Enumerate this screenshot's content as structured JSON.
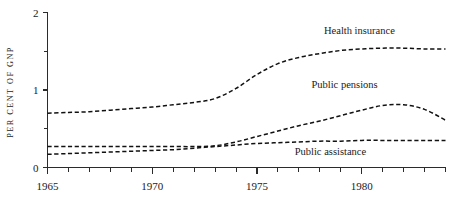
{
  "chart_data": {
    "type": "line",
    "title": "",
    "xlabel": "",
    "ylabel": "PER CENT OF GNP",
    "xlim": [
      1965,
      1984
    ],
    "ylim": [
      0,
      2
    ],
    "grid": false,
    "legend_position": "inline-right",
    "line_style": "dashed",
    "x_ticks_major": [
      1965,
      1970,
      1975,
      1980
    ],
    "x_tick_labels": [
      "1965",
      "1970",
      "1975",
      "1980"
    ],
    "x_ticks_minor": [
      1966,
      1967,
      1968,
      1969,
      1971,
      1972,
      1973,
      1974,
      1976,
      1977,
      1978,
      1979,
      1981,
      1982,
      1983,
      1984
    ],
    "y_ticks_major": [
      0,
      1,
      2
    ],
    "y_tick_labels": [
      "0",
      "1",
      "2"
    ],
    "y_ticks_minor": [
      0.5,
      1.5
    ],
    "x": [
      1965,
      1966,
      1967,
      1968,
      1969,
      1970,
      1971,
      1972,
      1973,
      1974,
      1975,
      1976,
      1977,
      1978,
      1979,
      1980,
      1981,
      1982,
      1983,
      1984
    ],
    "series": [
      {
        "name": "Health insurance",
        "label": "Health insurance",
        "label_x": 1978.2,
        "label_y": 1.72,
        "values": [
          0.7,
          0.71,
          0.72,
          0.74,
          0.76,
          0.78,
          0.81,
          0.84,
          0.89,
          1.02,
          1.2,
          1.34,
          1.42,
          1.47,
          1.51,
          1.53,
          1.54,
          1.54,
          1.53,
          1.53
        ]
      },
      {
        "name": "Public pensions",
        "label": "Public pensions",
        "label_x": 1977.6,
        "label_y": 1.02,
        "values": [
          0.27,
          0.27,
          0.27,
          0.27,
          0.27,
          0.27,
          0.27,
          0.27,
          0.28,
          0.33,
          0.4,
          0.47,
          0.54,
          0.6,
          0.67,
          0.74,
          0.8,
          0.81,
          0.75,
          0.61
        ]
      },
      {
        "name": "Public assistance",
        "label": "Public assistance",
        "label_x": 1976.8,
        "label_y": 0.16,
        "values": [
          0.17,
          0.18,
          0.19,
          0.2,
          0.21,
          0.22,
          0.23,
          0.25,
          0.27,
          0.29,
          0.31,
          0.32,
          0.33,
          0.34,
          0.34,
          0.35,
          0.35,
          0.35,
          0.35,
          0.35
        ]
      }
    ]
  }
}
